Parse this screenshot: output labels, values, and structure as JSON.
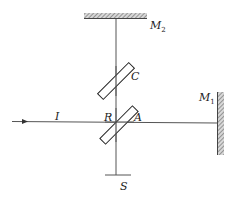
{
  "diagram": {
    "type": "Michelson interferometer schematic",
    "labels": {
      "mirror2": {
        "main": "M",
        "sub": "2"
      },
      "mirror1": {
        "main": "M",
        "sub": "1"
      },
      "compensator": "C",
      "reflect_point": "R",
      "split_point": "A",
      "source": "I",
      "screen": "S"
    },
    "colors": {
      "line": "#555555",
      "plate": "#222222",
      "hatch": "#777777",
      "text": "#222222"
    }
  }
}
